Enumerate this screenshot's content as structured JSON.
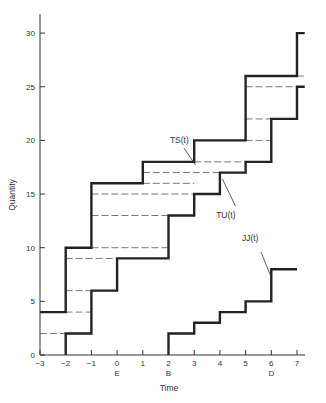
{
  "chart_data": {
    "type": "line",
    "subtype": "step",
    "title": "",
    "xlabel": "Time",
    "ylabel": "Quantity",
    "xlim": [
      -3,
      7.3
    ],
    "ylim": [
      0,
      32
    ],
    "x_ticks": [
      -3,
      -2,
      -1,
      0,
      1,
      2,
      3,
      4,
      5,
      6,
      7
    ],
    "y_ticks": [
      0,
      5,
      10,
      15,
      20,
      25,
      30
    ],
    "x_sub_labels": [
      {
        "x": 0,
        "label": "E"
      },
      {
        "x": 2,
        "label": "B"
      },
      {
        "x": 6,
        "label": "D"
      }
    ],
    "grid": false,
    "series": [
      {
        "name": "TS(t)",
        "steps": [
          [
            -3,
            4
          ],
          [
            -2,
            10
          ],
          [
            -1,
            16
          ],
          [
            1,
            18
          ],
          [
            3,
            20
          ],
          [
            5,
            26
          ],
          [
            7,
            30
          ]
        ],
        "end_x": 7.3,
        "label_pos": [
          2.6,
          19.8
        ]
      },
      {
        "name": "TU(t)",
        "steps": [
          [
            -2,
            2
          ],
          [
            -1,
            6
          ],
          [
            0,
            9
          ],
          [
            2,
            13
          ],
          [
            3,
            15
          ],
          [
            4,
            17
          ],
          [
            5,
            18
          ],
          [
            6,
            22
          ],
          [
            7,
            25
          ]
        ],
        "start": [
          -2,
          0
        ],
        "end_x": 7.3,
        "label_pos": [
          4.4,
          12.8
        ]
      },
      {
        "name": "JJ(t)",
        "steps": [
          [
            2,
            2
          ],
          [
            3,
            3
          ],
          [
            4,
            4
          ],
          [
            5,
            5
          ],
          [
            6,
            8
          ]
        ],
        "start": [
          2,
          0
        ],
        "end_x": 7,
        "label_pos": [
          5.4,
          10.6
        ]
      }
    ],
    "dashed_levels": [
      {
        "y": 2,
        "x0": -3,
        "x1": -2
      },
      {
        "y": 4,
        "x0": -2,
        "x1": -1
      },
      {
        "y": 6,
        "x0": -2,
        "x1": -1
      },
      {
        "y": 9,
        "x0": -2,
        "x1": 0
      },
      {
        "y": 10,
        "x0": -1,
        "x1": 2
      },
      {
        "y": 13,
        "x0": -1,
        "x1": 2
      },
      {
        "y": 15,
        "x0": -1,
        "x1": 3
      },
      {
        "y": 16,
        "x0": 1,
        "x1": 3
      },
      {
        "y": 17,
        "x0": 1,
        "x1": 4
      },
      {
        "y": 18,
        "x0": 3,
        "x1": 5
      },
      {
        "y": 20,
        "x0": 5,
        "x1": 6
      },
      {
        "y": 22,
        "x0": 5,
        "x1": 6
      },
      {
        "y": 25,
        "x0": 5,
        "x1": 7
      },
      {
        "y": 26,
        "x0": 7,
        "x1": 7.3
      }
    ],
    "caption": "Figure (caption partially cut off)"
  },
  "labels": {
    "xlabel": "Time",
    "ylabel": "Quantity",
    "ts": "TS(t)",
    "tu": "TU(t)",
    "jj": "JJ(t)",
    "caption": "Figure — Cumulative quantities over time"
  }
}
